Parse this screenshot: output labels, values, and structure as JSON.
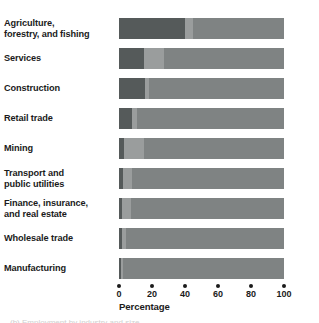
{
  "chart_data": {
    "type": "bar",
    "orientation": "horizontal",
    "stacked": true,
    "title": "",
    "xlabel": "Percentage",
    "ylabel": "",
    "xlim": [
      0,
      100
    ],
    "grid": false,
    "legend": "none",
    "xticks": [
      0,
      20,
      40,
      60,
      80,
      100
    ],
    "xtick_labels": [
      "0",
      "20",
      "40",
      "60",
      "80",
      "100"
    ],
    "categories": [
      "Agriculture, forestry, and fishing",
      "Services",
      "Construction",
      "Retail trade",
      "Mining",
      "Transport and public utilities",
      "Finance, insurance, and real estate",
      "Wholesale trade",
      "Manufacturing"
    ],
    "category_lines": [
      [
        "Agriculture,",
        "forestry, and fishing"
      ],
      [
        "Services"
      ],
      [
        "Construction"
      ],
      [
        "Retail trade"
      ],
      [
        "Mining"
      ],
      [
        "Transport and",
        "public utilities"
      ],
      [
        "Finance, insurance,",
        "and real estate"
      ],
      [
        "Wholesale trade"
      ],
      [
        "Manufacturing"
      ]
    ],
    "series": [
      {
        "name": "segment-1",
        "color": "#555a5a",
        "values": [
          40,
          15,
          16,
          8,
          3,
          2.5,
          2,
          2,
          1
        ]
      },
      {
        "name": "segment-2",
        "color": "#9a9d9d",
        "values": [
          5,
          12,
          2,
          3,
          12,
          5.5,
          5,
          2,
          1.5
        ]
      },
      {
        "name": "segment-3",
        "color": "#7f8383",
        "values": [
          55,
          73,
          82,
          89,
          85,
          92,
          93,
          96,
          97.5
        ]
      }
    ]
  },
  "axis": {
    "title": "Percentage"
  },
  "caption": {
    "clipped_text": "(b) Employment by industry and size"
  },
  "colors": {
    "segment_dark": "#555a5a",
    "segment_light": "#9a9d9d",
    "segment_mid": "#7f8383",
    "text": "#1b1b1b",
    "background": "#ffffff"
  }
}
